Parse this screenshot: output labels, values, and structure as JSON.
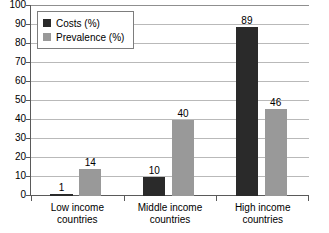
{
  "chart_data": {
    "type": "bar",
    "title": "",
    "xlabel": "",
    "ylabel": "",
    "ylim": [
      0,
      100
    ],
    "ytick_step": 10,
    "yticks": [
      100,
      90,
      80,
      70,
      60,
      50,
      40,
      30,
      20,
      10,
      0
    ],
    "grid": true,
    "legend_position": "upper-left-inside",
    "categories": [
      "Low income countries",
      "Middle income countries",
      "High income countries"
    ],
    "category_lines": [
      [
        "Low income",
        "countries"
      ],
      [
        "Middle income",
        "countries"
      ],
      [
        "High income",
        "countries"
      ]
    ],
    "series": [
      {
        "name": "Costs (%)",
        "color": "#2a2a2a",
        "values": [
          1,
          10,
          89
        ]
      },
      {
        "name": "Prevalence (%)",
        "color": "#999999",
        "values": [
          14,
          40,
          46
        ]
      }
    ]
  },
  "legend": {
    "items": [
      {
        "label": "Costs (%)",
        "color": "#2a2a2a"
      },
      {
        "label": "Prevalence (%)",
        "color": "#999999"
      }
    ]
  },
  "colors": {
    "costs": "#2a2a2a",
    "prevalence": "#999999",
    "gridline": "#b9b9b9",
    "axis": "#5a5a5a",
    "background": "#ffffff"
  }
}
